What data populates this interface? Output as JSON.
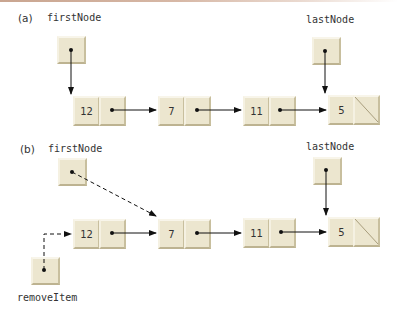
{
  "diagram": {
    "parts": [
      {
        "id": "a",
        "label": "(a)",
        "first_pointer_label": "firstNode",
        "last_pointer_label": "lastNode",
        "nodes": [
          "12",
          "7",
          "11",
          "5"
        ],
        "tail_null": true
      },
      {
        "id": "b",
        "label": "(b)",
        "first_pointer_label": "firstNode",
        "last_pointer_label": "lastNode",
        "remove_pointer_label": "removeItem",
        "nodes": [
          "12",
          "7",
          "11",
          "5"
        ],
        "tail_null": true,
        "dashed_links": [
          "firstNode -> 7",
          "removeItem -> 12"
        ]
      }
    ],
    "colors": {
      "node_fill": "#ece6cf",
      "arrow": "#111111",
      "top_rule": "#c9a590"
    }
  }
}
